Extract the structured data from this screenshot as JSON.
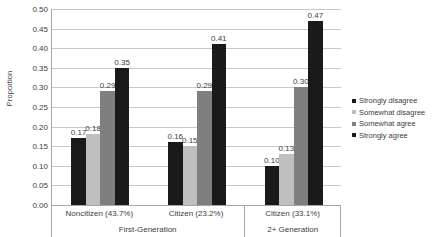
{
  "chart_data": {
    "type": "bar",
    "title": "",
    "xlabel": "",
    "ylabel": "Proportion",
    "ylim": [
      0.0,
      0.5
    ],
    "ytick_step": 0.05,
    "grid": true,
    "legend_position": "right",
    "categories": [
      "Noncitizen (43.7%)",
      "Citizen (23.2%)",
      "Citizen (33.1%)"
    ],
    "group_labels": [
      "First-Generation",
      "2+ Generation"
    ],
    "series": [
      {
        "name": "Strongly disagree",
        "color": "#1a1a1a",
        "values": [
          0.17,
          0.16,
          0.1
        ]
      },
      {
        "name": "Somewhat disagree",
        "color": "#bfbfbf",
        "values": [
          0.18,
          0.15,
          0.13
        ]
      },
      {
        "name": "Somewhat agree",
        "color": "#7f7f7f",
        "values": [
          0.29,
          0.29,
          0.3
        ]
      },
      {
        "name": "Strongly agree",
        "color": "#1a1a1a",
        "values": [
          0.35,
          0.41,
          0.47
        ]
      }
    ],
    "data_labels": [
      [
        "0.17",
        "0.18",
        "0.29",
        "0.35"
      ],
      [
        "0.16",
        "0.15",
        "0.29",
        "0.41"
      ],
      [
        "0.10",
        "0.13",
        "0.30",
        "0.47"
      ]
    ],
    "ytick_labels": [
      "0.50",
      "0.45",
      "0.40",
      "0.35",
      "0.30",
      "0.25",
      "0.20",
      "0.15",
      "0.10",
      "0.05",
      "0.00"
    ],
    "ytick_values": [
      0.5,
      0.45,
      0.4,
      0.35,
      0.3,
      0.25,
      0.2,
      0.15,
      0.1,
      0.05,
      0.0
    ]
  },
  "legend": {
    "items": [
      {
        "label": "Strongly disagree",
        "color": "#1a1a1a"
      },
      {
        "label": "Somewhat disagree",
        "color": "#bfbfbf"
      },
      {
        "label": "Somewhat agree",
        "color": "#7f7f7f"
      },
      {
        "label": "Strongly agree",
        "color": "#1a1a1a"
      }
    ]
  },
  "axis": {
    "y_title": "Proportion"
  }
}
